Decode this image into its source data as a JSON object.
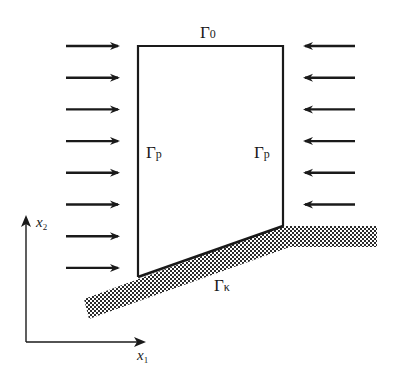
{
  "diagram": {
    "colors": {
      "stroke": "#1a1a1a",
      "hatch_dark": "#2a2a2a",
      "hatch_light": "#ffffff",
      "background": "#ffffff"
    },
    "boundary_labels": {
      "top": {
        "symbol": "Γ",
        "subscript": "0"
      },
      "left": {
        "symbol": "Γ",
        "subscript": "p"
      },
      "right": {
        "symbol": "Γ",
        "subscript": "p"
      },
      "contact": {
        "symbol": "Γ",
        "subscript": "κ"
      }
    },
    "axes": {
      "x": {
        "symbol": "x",
        "subscript": "1"
      },
      "y": {
        "symbol": "x",
        "subscript": "2"
      }
    },
    "loads": {
      "left_arrows": {
        "count": 8,
        "direction": "right"
      },
      "right_arrows": {
        "count": 6,
        "direction": "left"
      }
    },
    "foundation": {
      "pattern": "cross-hatched",
      "shape": "inclined then horizontal"
    }
  }
}
